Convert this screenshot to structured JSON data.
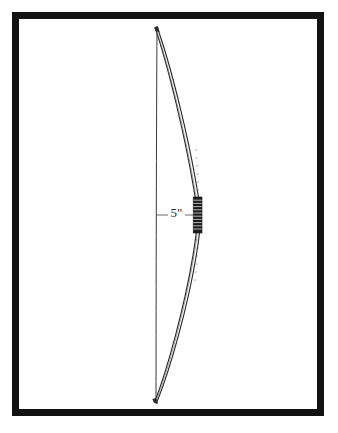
{
  "figure": {
    "kind": "technical-line-drawing",
    "orientation": "vertical",
    "background_color": "#ffffff",
    "ink_color": "#2b2b2b",
    "frame": {
      "border_color": "#121212",
      "border_width_px": 7,
      "x": 12,
      "y": 12,
      "width": 312,
      "height": 404
    }
  },
  "annotations": {
    "brace_height": {
      "label": "5\"",
      "leader_from_x": 157,
      "leader_to_x": 194,
      "leader_y": 215,
      "text_x": 176,
      "text_y": 214
    }
  },
  "bow": {
    "string": {
      "name": "bowstring",
      "top_x": 157,
      "top_y": 27,
      "bottom_x": 156,
      "bottom_y": 403,
      "color": "#3a3a3a",
      "stroke_width": 1
    },
    "limb": {
      "name": "bow-limb-profile",
      "top_tip_x": 157,
      "top_tip_y": 27,
      "bottom_tip_x": 156,
      "bottom_tip_y": 403,
      "max_bulge_x": 201,
      "max_bulge_y": 215,
      "color": "#2b2b2b",
      "outline_stroke_width": 1.2
    },
    "grip": {
      "name": "bow-grip-wrap",
      "x": 193,
      "y": 197,
      "width": 9,
      "height": 36,
      "band_count": 11,
      "color": "#1a1a1a"
    }
  }
}
